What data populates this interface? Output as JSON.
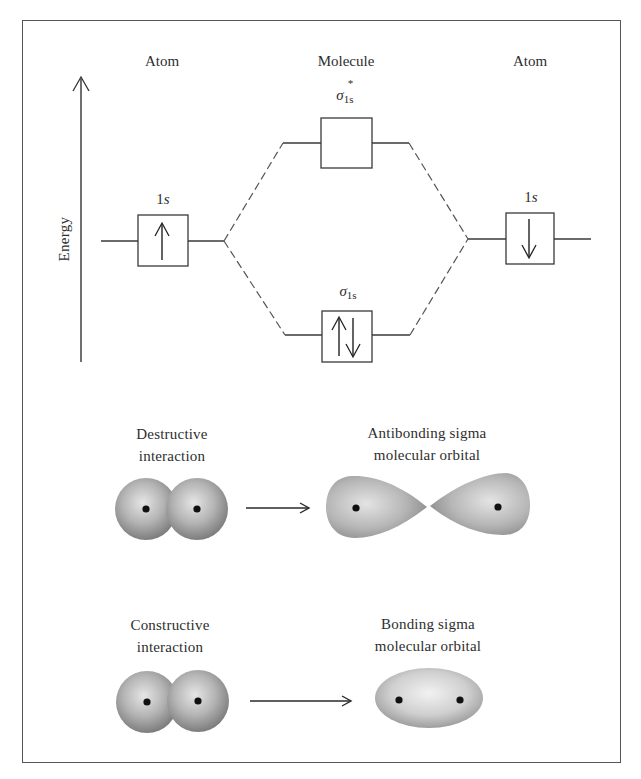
{
  "energy_diagram": {
    "axis_label": "Energy",
    "columns": {
      "left": "Atom",
      "middle": "Molecule",
      "right": "Atom"
    },
    "levels": {
      "left_atomic": {
        "label_main": "1",
        "label_italic": "s",
        "electrons": "up"
      },
      "right_atomic": {
        "label_main": "1",
        "label_italic": "s",
        "electrons": "down"
      },
      "antibonding": {
        "symbol": "σ",
        "subscript": "1s",
        "superscript": "*",
        "electrons": "none"
      },
      "bonding": {
        "symbol": "σ",
        "subscript": "1s",
        "electrons": "up-down"
      }
    }
  },
  "interactions": {
    "destructive": {
      "label_line1": "Destructive",
      "label_line2": "interaction",
      "result_line1": "Antibonding sigma",
      "result_line2": "molecular orbital"
    },
    "constructive": {
      "label_line1": "Constructive",
      "label_line2": "interaction",
      "result_line1": "Bonding sigma",
      "result_line2": "molecular orbital"
    }
  },
  "colors": {
    "line": "#3a3a3a",
    "dashed": "#555555",
    "sphere_edge": "#7d7d7d",
    "sphere_highlight": "#e6e6e6",
    "nucleus": "#111111"
  }
}
